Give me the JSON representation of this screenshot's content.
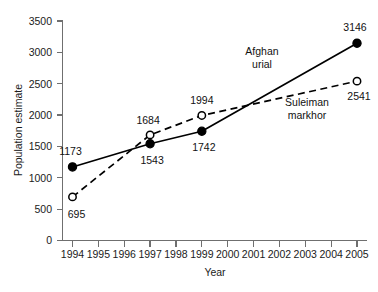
{
  "chart_data": {
    "type": "line",
    "title": "",
    "subtitle": "",
    "xlabel": "Year",
    "ylabel": "Population estimate",
    "x": [
      1994,
      1997,
      1999,
      2005
    ],
    "xticks": [
      "1994",
      "1995",
      "1996",
      "1997",
      "1998",
      "1999",
      "2000",
      "2001",
      "2002",
      "2003",
      "2004",
      "2005"
    ],
    "xlim": [
      1994,
      2005
    ],
    "yticks": [
      "0",
      "500",
      "1000",
      "1500",
      "2000",
      "2500",
      "3000",
      "3500"
    ],
    "ylim": [
      0,
      3500
    ],
    "grid": false,
    "legend_position": "inline-annotations",
    "series": [
      {
        "name": "Afghan urial",
        "marker": "filled-circle",
        "linestyle": "solid",
        "color": "#000000",
        "x": [
          1994,
          1997,
          1999,
          2005
        ],
        "values": [
          1173,
          1543,
          1742,
          3146
        ],
        "labels": [
          "1173",
          "1543",
          "1742",
          "3146"
        ]
      },
      {
        "name": "Suleiman markhor",
        "marker": "open-circle",
        "linestyle": "dashed",
        "color": "#000000",
        "x": [
          1994,
          1997,
          1999,
          2005
        ],
        "values": [
          695,
          1684,
          1994,
          2541
        ],
        "labels": [
          "695",
          "1684",
          "1994",
          "2541"
        ]
      }
    ],
    "annotations": [
      {
        "text_line1": "Afghan",
        "text_line2": "urial",
        "for_series": "Afghan urial"
      },
      {
        "text_line1": "Suleiman",
        "text_line2": "markhor",
        "for_series": "Suleiman markhor"
      }
    ]
  },
  "axes": {
    "y_title": "Population estimate",
    "x_title": "Year"
  },
  "colors": {
    "background": "#ffffff",
    "axis": "#6f6f6f",
    "ink": "#000000",
    "text": "#1b1b1b"
  }
}
